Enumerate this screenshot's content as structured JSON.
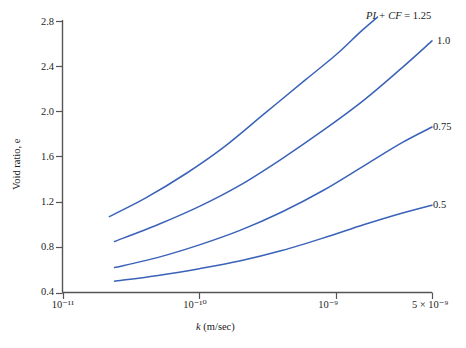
{
  "chart_data": {
    "type": "line",
    "title": "",
    "xlabel": "k (m/sec)",
    "ylabel": "Void ratio, e",
    "xscale": "log",
    "yscale": "linear",
    "xlim": [
      1e-11,
      5e-09
    ],
    "ylim": [
      0.4,
      2.8
    ],
    "grid": false,
    "legend_position": "right-of-curve-ends",
    "xticks": [
      {
        "value": 1e-11,
        "label": "10⁻¹¹"
      },
      {
        "value": 1e-10,
        "label": "10⁻¹⁰"
      },
      {
        "value": 1e-09,
        "label": "10⁻⁹"
      },
      {
        "value": 5e-09,
        "label": "5 × 10⁻⁹"
      }
    ],
    "yticks": [
      0.4,
      0.8,
      1.2,
      1.6,
      2.0,
      2.4,
      2.8
    ],
    "series": [
      {
        "name": "PI + CF = 1.25",
        "label": "PI + CF = 1.25",
        "color": "#3a62b8",
        "x": [
          2.2e-11,
          4e-11,
          8e-11,
          1.5e-10,
          3e-10,
          6e-10,
          1e-09,
          1.5e-09,
          2e-09
        ],
        "y": [
          1.07,
          1.23,
          1.45,
          1.68,
          1.98,
          2.28,
          2.5,
          2.7,
          2.83
        ]
      },
      {
        "name": "PI + CF = 1.0",
        "label": "1.0",
        "color": "#3a62b8",
        "x": [
          2.4e-11,
          5e-11,
          1e-10,
          2e-10,
          4e-10,
          8e-10,
          1.6e-09,
          3e-09,
          5e-09
        ],
        "y": [
          0.85,
          1.0,
          1.16,
          1.35,
          1.58,
          1.83,
          2.1,
          2.38,
          2.62
        ]
      },
      {
        "name": "PI + CF = 0.75",
        "label": "0.75",
        "color": "#3a62b8",
        "x": [
          2.4e-11,
          5e-11,
          1e-10,
          2e-10,
          4e-10,
          8e-10,
          1.6e-09,
          3e-09,
          5e-09
        ],
        "y": [
          0.62,
          0.71,
          0.82,
          0.95,
          1.11,
          1.3,
          1.52,
          1.72,
          1.86
        ]
      },
      {
        "name": "PI + CF = 0.5",
        "label": "0.5",
        "color": "#3a62b8",
        "x": [
          2.4e-11,
          5e-11,
          1e-10,
          2e-10,
          4e-10,
          8e-10,
          1.6e-09,
          3e-09,
          5e-09
        ],
        "y": [
          0.5,
          0.55,
          0.61,
          0.68,
          0.77,
          0.88,
          1.0,
          1.1,
          1.17
        ]
      }
    ],
    "annotations": [
      {
        "text_prefix_italic": "PI + CF",
        "text_rest": " = 1.25"
      },
      {
        "text_rest": "1.0"
      },
      {
        "text_rest": "0.75"
      },
      {
        "text_rest": "0.5"
      }
    ]
  },
  "axes": {
    "y_tick_labels": [
      "2.8",
      "2.4",
      "2.0",
      "1.6",
      "1.2",
      "0.8",
      "0.4"
    ],
    "x_tick_labels": [
      "10⁻¹¹",
      "10⁻¹⁰",
      "10⁻⁹",
      "5 × 10⁻⁹"
    ],
    "y_title": "Void ratio, e",
    "x_title_symbol": "k",
    "x_title_rest": " (m/sec)",
    "axis_color": "#555555"
  },
  "labels": {
    "curve1_italic": "PI + CF",
    "curve1_rest": " = 1.25",
    "curve2": "1.0",
    "curve3": "0.75",
    "curve4": "0.5"
  },
  "colors": {
    "curve": "#3a62b8",
    "axis": "#555555",
    "text": "#1a1a1a",
    "background": "#ffffff"
  }
}
